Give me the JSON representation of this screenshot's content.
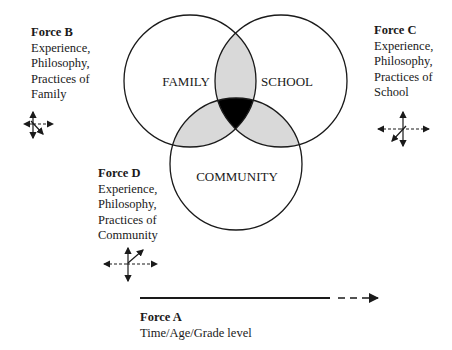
{
  "diagram": {
    "type": "venn",
    "circles": [
      {
        "id": "family",
        "label": "FAMILY"
      },
      {
        "id": "school",
        "label": "SCHOOL"
      },
      {
        "id": "community",
        "label": "COMMUNITY"
      }
    ],
    "colors": {
      "outline": "#1a1a1a",
      "pairwise_overlap": "#d9d9d9",
      "triple_overlap": "#000000",
      "background": "#ffffff"
    }
  },
  "forces": {
    "b": {
      "title": "Force B",
      "lines": [
        "Experience,",
        "Philosophy,",
        "Practices of",
        "Family"
      ]
    },
    "c": {
      "title": "Force C",
      "lines": [
        "Experience,",
        "Philosophy,",
        "Practices of",
        "School"
      ]
    },
    "d": {
      "title": "Force D",
      "lines": [
        "Experience,",
        "Philosophy,",
        "Practices of",
        "Community"
      ]
    },
    "a": {
      "title": "Force A",
      "lines": [
        "Time/Age/Grade level"
      ]
    }
  },
  "icons": {
    "force_b": "multi-direction-arrows-icon",
    "force_c": "multi-direction-arrows-icon",
    "force_d": "multi-direction-arrows-icon",
    "force_a": "time-arrow-icon"
  }
}
